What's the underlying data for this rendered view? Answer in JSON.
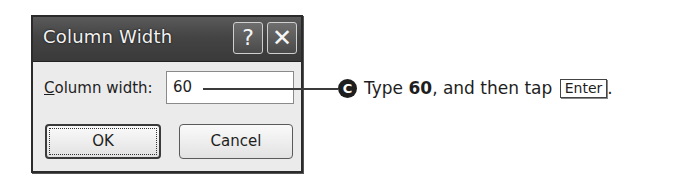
{
  "dialog": {
    "title": "Column Width",
    "help_glyph": "?",
    "close_glyph": "✕",
    "field_label_mnemonic": "C",
    "field_label_rest": "olumn width:",
    "field_value": "60",
    "ok_label": "OK",
    "cancel_label": "Cancel"
  },
  "callout": {
    "step_letter": "C",
    "text_before": "Type ",
    "text_value": "60",
    "text_middle": ", and then tap ",
    "key_label": "Enter",
    "text_after": "."
  }
}
